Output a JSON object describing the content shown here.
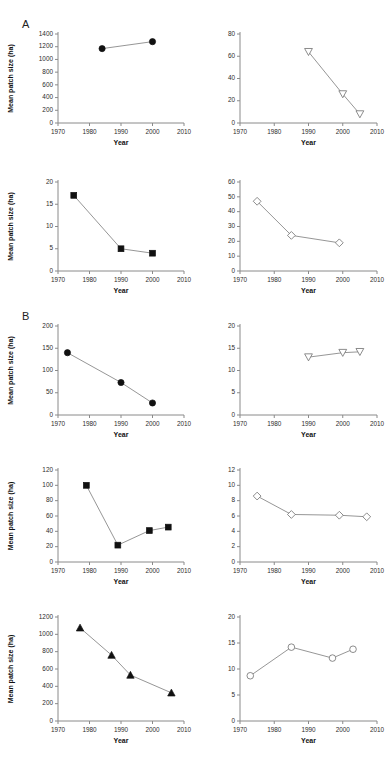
{
  "figure": {
    "group_labels": [
      {
        "text": "A",
        "x": 22,
        "y": 18
      },
      {
        "text": "B",
        "x": 22,
        "y": 310
      }
    ],
    "shared": {
      "ylabel": "Mean patch size (ha)",
      "xlabel": "Year",
      "xticks": [
        1970,
        1980,
        1990,
        2000,
        2010
      ],
      "xlim": [
        1970,
        2010
      ]
    }
  },
  "chart_data": [
    {
      "id": "panel-a1",
      "type": "line",
      "title": "",
      "xlabel": "Year",
      "ylabel": "Mean patch size (ha)",
      "xlim": [
        1970,
        2010
      ],
      "ylim": [
        0,
        1400
      ],
      "xticks": [
        1970,
        1980,
        1990,
        2000,
        2010
      ],
      "yticks": [
        0,
        200,
        400,
        600,
        800,
        1000,
        1200,
        1400
      ],
      "marker": "filled-circle",
      "grid": false,
      "legend": "none",
      "x": [
        1984,
        2000
      ],
      "values": [
        1170,
        1280
      ]
    },
    {
      "id": "panel-a2",
      "type": "line",
      "title": "",
      "xlabel": "Year",
      "ylabel": "",
      "xlim": [
        1970,
        2010
      ],
      "ylim": [
        0,
        80
      ],
      "xticks": [
        1970,
        1980,
        1990,
        2000,
        2010
      ],
      "yticks": [
        0,
        20,
        40,
        60,
        80
      ],
      "marker": "open-triangle-down",
      "grid": false,
      "legend": "none",
      "x": [
        1990,
        2000,
        2005
      ],
      "values": [
        64,
        26,
        8
      ]
    },
    {
      "id": "panel-a3",
      "type": "line",
      "title": "",
      "xlabel": "Year",
      "ylabel": "Mean patch size (ha)",
      "xlim": [
        1970,
        2010
      ],
      "ylim": [
        0,
        20
      ],
      "xticks": [
        1970,
        1980,
        1990,
        2000,
        2010
      ],
      "yticks": [
        0,
        5,
        10,
        15,
        20
      ],
      "marker": "filled-square",
      "grid": false,
      "legend": "none",
      "x": [
        1975,
        1990,
        2000
      ],
      "values": [
        17,
        5,
        4
      ]
    },
    {
      "id": "panel-a4",
      "type": "line",
      "title": "",
      "xlabel": "Year",
      "ylabel": "",
      "xlim": [
        1970,
        2010
      ],
      "ylim": [
        0,
        60
      ],
      "xticks": [
        1970,
        1980,
        1990,
        2000,
        2010
      ],
      "yticks": [
        0,
        10,
        20,
        30,
        40,
        50,
        60
      ],
      "marker": "open-diamond",
      "grid": false,
      "legend": "none",
      "x": [
        1975,
        1985,
        1999
      ],
      "values": [
        47,
        24,
        19
      ]
    },
    {
      "id": "panel-b1",
      "type": "line",
      "title": "",
      "xlabel": "Year",
      "ylabel": "Mean patch size (ha)",
      "xlim": [
        1970,
        2010
      ],
      "ylim": [
        0,
        200
      ],
      "xticks": [
        1970,
        1980,
        1990,
        2000,
        2010
      ],
      "yticks": [
        0,
        50,
        100,
        150,
        200
      ],
      "marker": "filled-circle",
      "grid": false,
      "legend": "none",
      "x": [
        1973,
        1990,
        2000
      ],
      "values": [
        140,
        73,
        27
      ]
    },
    {
      "id": "panel-b2",
      "type": "line",
      "title": "",
      "xlabel": "Year",
      "ylabel": "",
      "xlim": [
        1970,
        2010
      ],
      "ylim": [
        0,
        20
      ],
      "xticks": [
        1970,
        1980,
        1990,
        2000,
        2010
      ],
      "yticks": [
        0,
        5,
        10,
        15,
        20
      ],
      "marker": "open-triangle-down",
      "grid": false,
      "legend": "none",
      "x": [
        1990,
        2000,
        2005
      ],
      "values": [
        13.0,
        14.0,
        14.2
      ]
    },
    {
      "id": "panel-b3",
      "type": "line",
      "title": "",
      "xlabel": "Year",
      "ylabel": "Mean patch size (ha)",
      "xlim": [
        1970,
        2010
      ],
      "ylim": [
        0,
        120
      ],
      "xticks": [
        1970,
        1980,
        1990,
        2000,
        2010
      ],
      "yticks": [
        0,
        20,
        40,
        60,
        80,
        100,
        120
      ],
      "marker": "filled-square",
      "grid": false,
      "legend": "none",
      "x": [
        1979,
        1989,
        1999,
        2005
      ],
      "values": [
        100,
        22,
        41,
        45.5
      ]
    },
    {
      "id": "panel-b4",
      "type": "line",
      "title": "",
      "xlabel": "Year",
      "ylabel": "",
      "xlim": [
        1970,
        2010
      ],
      "ylim": [
        0,
        12
      ],
      "xticks": [
        1970,
        1980,
        1990,
        2000,
        2010
      ],
      "yticks": [
        0,
        2,
        4,
        6,
        8,
        10,
        12
      ],
      "marker": "open-diamond",
      "grid": false,
      "legend": "none",
      "x": [
        1975,
        1985,
        1999,
        2007
      ],
      "values": [
        8.6,
        6.2,
        6.1,
        5.9
      ]
    },
    {
      "id": "panel-c1",
      "type": "line",
      "title": "",
      "xlabel": "Year",
      "ylabel": "Mean patch size (ha)",
      "xlim": [
        1970,
        2010
      ],
      "ylim": [
        0,
        1200
      ],
      "xticks": [
        1970,
        1980,
        1990,
        2000,
        2010
      ],
      "yticks": [
        0,
        200,
        400,
        600,
        800,
        1000,
        1200
      ],
      "marker": "filled-triangle-up",
      "grid": false,
      "legend": "none",
      "x": [
        1977,
        1987,
        1993,
        2006
      ],
      "values": [
        1075,
        760,
        530,
        325
      ]
    },
    {
      "id": "panel-c2",
      "type": "line",
      "title": "",
      "xlabel": "Year",
      "ylabel": "",
      "xlim": [
        1970,
        2010
      ],
      "ylim": [
        0,
        20
      ],
      "xticks": [
        1970,
        1980,
        1990,
        2000,
        2010
      ],
      "yticks": [
        0,
        5,
        10,
        15,
        20
      ],
      "marker": "open-circle",
      "grid": false,
      "legend": "none",
      "x": [
        1973,
        1985,
        1997,
        2003
      ],
      "values": [
        8.7,
        14.2,
        12.1,
        13.8
      ]
    }
  ],
  "panel_layout": [
    {
      "id": "panel-a1",
      "left": 0,
      "top": 22,
      "width": 196,
      "height": 135,
      "show_ylabel": true,
      "show_xlabel": true
    },
    {
      "id": "panel-a2",
      "left": 196,
      "top": 22,
      "width": 193,
      "height": 135,
      "show_ylabel": false,
      "show_xlabel": true
    },
    {
      "id": "panel-a3",
      "left": 0,
      "top": 170,
      "width": 196,
      "height": 135,
      "show_ylabel": true,
      "show_xlabel": true
    },
    {
      "id": "panel-a4",
      "left": 196,
      "top": 170,
      "width": 193,
      "height": 135,
      "show_ylabel": false,
      "show_xlabel": true
    },
    {
      "id": "panel-b1",
      "left": 0,
      "top": 314,
      "width": 196,
      "height": 135,
      "show_ylabel": true,
      "show_xlabel": true
    },
    {
      "id": "panel-b2",
      "left": 196,
      "top": 314,
      "width": 193,
      "height": 135,
      "show_ylabel": false,
      "show_xlabel": true
    },
    {
      "id": "panel-b3",
      "left": 0,
      "top": 458,
      "width": 196,
      "height": 138,
      "show_ylabel": true,
      "show_xlabel": true
    },
    {
      "id": "panel-b4",
      "left": 196,
      "top": 458,
      "width": 193,
      "height": 138,
      "show_ylabel": false,
      "show_xlabel": true
    },
    {
      "id": "panel-c1",
      "left": 0,
      "top": 605,
      "width": 196,
      "height": 150,
      "show_ylabel": true,
      "show_xlabel": true
    },
    {
      "id": "panel-c2",
      "left": 196,
      "top": 605,
      "width": 193,
      "height": 150,
      "show_ylabel": false,
      "show_xlabel": true
    }
  ]
}
